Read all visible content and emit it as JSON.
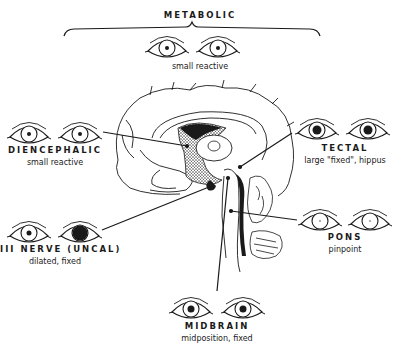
{
  "diagram": {
    "colors": {
      "ink": "#1a1a1a",
      "background": "#ffffff"
    },
    "groups": [
      {
        "id": "metabolic",
        "title": "METABOLIC",
        "description": "small reactive",
        "pupils": {
          "left": "small",
          "right": "small"
        }
      },
      {
        "id": "diencephalic",
        "title": "DIENCEPHALIC",
        "description": "small reactive",
        "pupils": {
          "left": "small",
          "right": "small"
        }
      },
      {
        "id": "tectal",
        "title": "TECTAL",
        "description": "large \"fixed\", hippus",
        "pupils": {
          "left": "large",
          "right": "large"
        }
      },
      {
        "id": "iii-nerve",
        "title": "III NERVE (UNCAL)",
        "description": "dilated, fixed",
        "pupils": {
          "left": "small",
          "right": "dilated"
        }
      },
      {
        "id": "pons",
        "title": "PONS",
        "description": "pinpoint",
        "pupils": {
          "left": "pinpoint",
          "right": "pinpoint"
        }
      },
      {
        "id": "midbrain",
        "title": "MIDBRAIN",
        "description": "midposition, fixed",
        "pupils": {
          "left": "mid",
          "right": "mid"
        }
      }
    ]
  }
}
